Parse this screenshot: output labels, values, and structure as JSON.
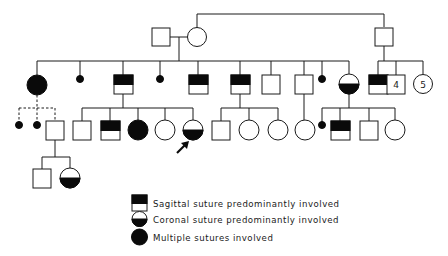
{
  "figure": {
    "type": "pedigree",
    "colors": {
      "ink": "#0a0a0a",
      "background": "#ffffff"
    }
  },
  "legend": [
    {
      "symbol": "sagittal",
      "label": "Sagittal suture predominantly involved"
    },
    {
      "symbol": "coronal",
      "label": "Coronal suture predominantly involved"
    },
    {
      "symbol": "multiple",
      "label": "Multiple sutures involved"
    }
  ],
  "pedigree": {
    "generation_I": [
      {
        "id": "I-1",
        "sex": "male",
        "status": "unaffected"
      },
      {
        "id": "I-2",
        "sex": "female",
        "status": "unaffected"
      },
      {
        "id": "I-3",
        "sex": "male",
        "status": "unaffected"
      }
    ],
    "generation_II": [
      {
        "id": "II-1",
        "sex": "female",
        "status": "multiple",
        "parents": "I-1+I-2"
      },
      {
        "id": "II-2",
        "sex": "unknown",
        "status": "miscarriage",
        "parents": "I-1+I-2"
      },
      {
        "id": "II-3",
        "sex": "male",
        "status": "sagittal",
        "parents": "I-1+I-2"
      },
      {
        "id": "II-4",
        "sex": "unknown",
        "status": "miscarriage",
        "parents": "I-1+I-2"
      },
      {
        "id": "II-5",
        "sex": "male",
        "status": "sagittal",
        "parents": "I-1+I-2"
      },
      {
        "id": "II-6",
        "sex": "male",
        "status": "sagittal",
        "parents": "I-1+I-2"
      },
      {
        "id": "II-7",
        "sex": "male",
        "status": "unaffected",
        "parents": "I-1+I-2"
      },
      {
        "id": "II-8",
        "sex": "male",
        "status": "unaffected",
        "parents": "I-1+I-2"
      },
      {
        "id": "II-9",
        "sex": "unknown",
        "status": "miscarriage",
        "parents": "I-1+I-2"
      },
      {
        "id": "II-10",
        "sex": "female",
        "status": "coronal",
        "parents": "I-1+I-2"
      },
      {
        "id": "II-11",
        "sex": "male",
        "status": "sagittal",
        "parents": "I-3"
      },
      {
        "id": "II-12",
        "sex": "male",
        "status": "unaffected",
        "count": "4",
        "parents": "I-3"
      },
      {
        "id": "II-13",
        "sex": "female",
        "status": "unaffected",
        "count": "5",
        "parents": "I-3"
      }
    ],
    "generation_III": [
      {
        "id": "III-1",
        "sex": "unknown",
        "status": "miscarriage",
        "parents": "II-1",
        "uncertain": true
      },
      {
        "id": "III-2",
        "sex": "unknown",
        "status": "miscarriage",
        "parents": "II-1",
        "uncertain": true
      },
      {
        "id": "III-3",
        "sex": "male",
        "status": "unaffected",
        "parents": "II-1",
        "uncertain": true
      },
      {
        "id": "III-4",
        "sex": "male",
        "status": "unaffected",
        "parents": "II-3"
      },
      {
        "id": "III-5",
        "sex": "male",
        "status": "sagittal",
        "parents": "II-3"
      },
      {
        "id": "III-6",
        "sex": "female",
        "status": "multiple",
        "parents": "II-3"
      },
      {
        "id": "III-7",
        "sex": "female",
        "status": "unaffected",
        "parents": "II-3"
      },
      {
        "id": "III-8",
        "sex": "female",
        "status": "coronal",
        "parents": "II-3",
        "proband": true
      },
      {
        "id": "III-9",
        "sex": "male",
        "status": "unaffected",
        "parents": "II-6"
      },
      {
        "id": "III-10",
        "sex": "female",
        "status": "unaffected",
        "parents": "II-6"
      },
      {
        "id": "III-11",
        "sex": "female",
        "status": "unaffected",
        "parents": "II-6"
      },
      {
        "id": "III-12",
        "sex": "female",
        "status": "unaffected",
        "parents": "II-8"
      },
      {
        "id": "III-13",
        "sex": "unknown",
        "status": "miscarriage",
        "parents": "II-10"
      },
      {
        "id": "III-14",
        "sex": "male",
        "status": "sagittal",
        "parents": "II-10"
      },
      {
        "id": "III-15",
        "sex": "male",
        "status": "unaffected",
        "parents": "II-10"
      },
      {
        "id": "III-16",
        "sex": "female",
        "status": "unaffected",
        "parents": "II-10"
      }
    ],
    "generation_IV": [
      {
        "id": "IV-1",
        "sex": "male",
        "status": "unaffected",
        "parents": "III-3"
      },
      {
        "id": "IV-2",
        "sex": "female",
        "status": "coronal",
        "parents": "III-3"
      }
    ]
  }
}
